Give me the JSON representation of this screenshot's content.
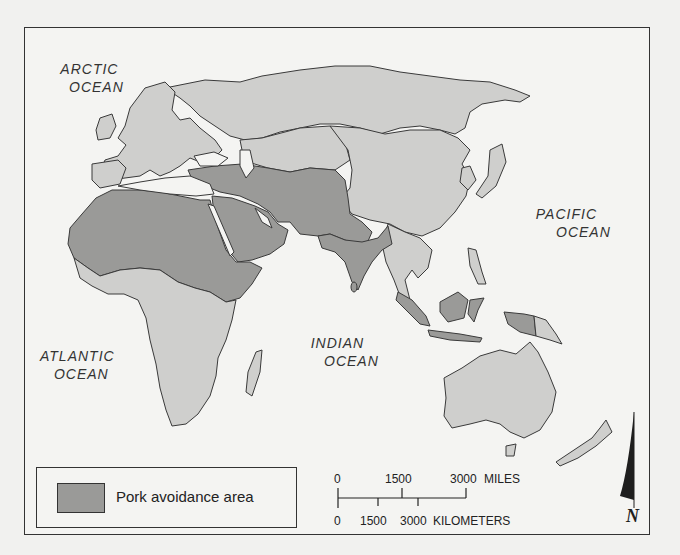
{
  "map": {
    "title": "Pork avoidance area map of the Eastern Hemisphere",
    "colors": {
      "avoidance_fill": "#9a9a98",
      "other_land_fill": "#cfcfcd",
      "water": "#f4f4f2",
      "border": "#3a3a3a"
    },
    "ocean_labels": [
      {
        "name": "ARCTIC OCEAN",
        "line1": "ARCTIC",
        "line2": "OCEAN"
      },
      {
        "name": "ATLANTIC OCEAN",
        "line1": "ATLANTIC",
        "line2": "OCEAN"
      },
      {
        "name": "INDIAN OCEAN",
        "line1": "INDIAN",
        "line2": "OCEAN"
      },
      {
        "name": "PACIFIC OCEAN",
        "line1": "PACIFIC",
        "line2": "OCEAN"
      }
    ],
    "regions": {
      "pork_avoidance": [
        "North Africa",
        "Sahel",
        "Horn of Africa",
        "Middle East",
        "Arabian Peninsula",
        "Turkey",
        "Iran",
        "Afghanistan",
        "Pakistan",
        "Central Asia (partial)",
        "India",
        "Bangladesh",
        "Malaysia",
        "Indonesia (western)",
        "Brunei"
      ],
      "other": [
        "Europe",
        "Russia",
        "China",
        "Mongolia",
        "Japan",
        "Korea",
        "Southeast Asia mainland",
        "Sub-Saharan Africa (central & southern)",
        "Australia",
        "New Zealand",
        "Papua New Guinea",
        "Philippines",
        "Madagascar"
      ]
    }
  },
  "legend": {
    "label": "Pork avoidance area"
  },
  "scale": {
    "miles": {
      "ticks": [
        "0",
        "1500",
        "3000"
      ],
      "unit": "MILES"
    },
    "kilometers": {
      "ticks": [
        "0",
        "1500",
        "3000"
      ],
      "unit": "KILOMETERS"
    }
  },
  "north_arrow": {
    "label": "N"
  }
}
